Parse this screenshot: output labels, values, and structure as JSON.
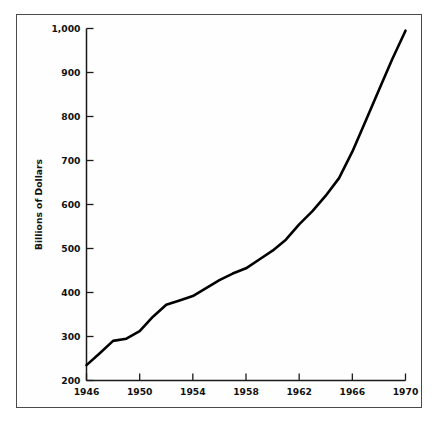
{
  "figure": {
    "background_color": "#ffffff",
    "frame_color": "#4a4a4a",
    "line_color": "#000000"
  },
  "chart_data": {
    "type": "line",
    "title": "",
    "subtitle": "",
    "xlabel": "",
    "ylabel": "Billions of Dollars",
    "xlim": [
      1946,
      1970
    ],
    "ylim": [
      200,
      1000
    ],
    "grid": false,
    "legend": false,
    "legend_position": "none",
    "x_tick_labels": [
      "1946",
      "1950",
      "1954",
      "1958",
      "1962",
      "1966",
      "1970"
    ],
    "x_tick_values": [
      1946,
      1950,
      1954,
      1958,
      1962,
      1966,
      1970
    ],
    "y_tick_labels": [
      "200",
      "300",
      "400",
      "500",
      "600",
      "700",
      "800",
      "900",
      "1,000"
    ],
    "y_tick_values": [
      200,
      300,
      400,
      500,
      600,
      700,
      800,
      900,
      1000
    ],
    "x": [
      1946,
      1947,
      1948,
      1949,
      1950,
      1951,
      1952,
      1953,
      1954,
      1955,
      1956,
      1957,
      1958,
      1959,
      1960,
      1961,
      1962,
      1963,
      1964,
      1965,
      1966,
      1967,
      1968,
      1969,
      1970
    ],
    "values": [
      235,
      262,
      290,
      295,
      312,
      345,
      372,
      382,
      392,
      410,
      428,
      443,
      455,
      475,
      495,
      520,
      555,
      585,
      620,
      660,
      720,
      790,
      860,
      930,
      995
    ],
    "series": [
      {
        "name": "Billions of Dollars",
        "values": [
          235,
          262,
          290,
          295,
          312,
          345,
          372,
          382,
          392,
          410,
          428,
          443,
          455,
          475,
          495,
          520,
          555,
          585,
          620,
          660,
          720,
          790,
          860,
          930,
          995
        ]
      }
    ],
    "annotations": []
  }
}
